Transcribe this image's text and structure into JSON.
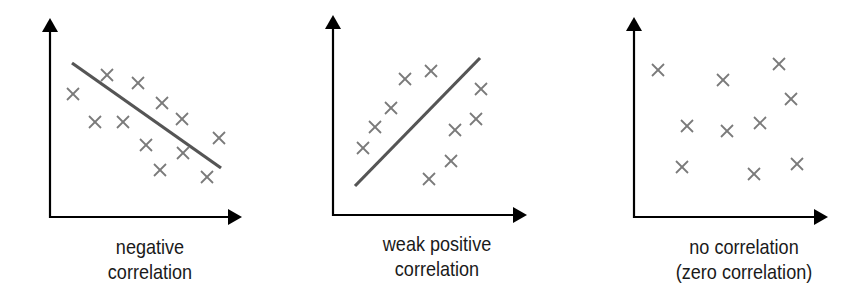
{
  "colors": {
    "axis": "#000000",
    "marker": "#7a7a7a",
    "trend_line": "#555555",
    "text": "#1a1a1a",
    "background": "#ffffff"
  },
  "chart_data": [
    {
      "type": "scatter",
      "title": "negative correlation",
      "caption_lines": [
        "negative",
        "correlation"
      ],
      "xlabel": "",
      "ylabel": "",
      "marker": "x",
      "grid": false,
      "axes": {
        "origin": [
          50,
          217
        ],
        "y_tip": [
          50,
          18
        ],
        "x_tip": [
          242,
          217
        ]
      },
      "points": [
        [
          73,
          94
        ],
        [
          107,
          75
        ],
        [
          138,
          83
        ],
        [
          95,
          122
        ],
        [
          123,
          122
        ],
        [
          162,
          103
        ],
        [
          182,
          119
        ],
        [
          146,
          145
        ],
        [
          219,
          138
        ],
        [
          183,
          153
        ],
        [
          160,
          170
        ],
        [
          207,
          177
        ]
      ],
      "trend_line": {
        "from": [
          72,
          63
        ],
        "to": [
          221,
          168
        ]
      },
      "caption_center_x": 150
    },
    {
      "type": "scatter",
      "title": "weak positive correlation",
      "caption_lines": [
        "weak positive",
        "correlation"
      ],
      "xlabel": "",
      "ylabel": "",
      "marker": "x",
      "grid": false,
      "axes": {
        "origin": [
          333,
          215
        ],
        "y_tip": [
          333,
          15
        ],
        "x_tip": [
          527,
          215
        ]
      },
      "points": [
        [
          363,
          148
        ],
        [
          375,
          127
        ],
        [
          391,
          108
        ],
        [
          405,
          79
        ],
        [
          431,
          71
        ],
        [
          481,
          89
        ],
        [
          476,
          119
        ],
        [
          455,
          130
        ],
        [
          451,
          161
        ],
        [
          429,
          179
        ]
      ],
      "trend_line": {
        "from": [
          355,
          186
        ],
        "to": [
          480,
          58
        ]
      },
      "caption_center_x": 437
    },
    {
      "type": "scatter",
      "title": "no correlation (zero correlation)",
      "caption_lines": [
        "no correlation",
        "(zero correlation)"
      ],
      "xlabel": "",
      "ylabel": "",
      "marker": "x",
      "grid": false,
      "axes": {
        "origin": [
          634,
          217
        ],
        "y_tip": [
          634,
          17
        ],
        "x_tip": [
          828,
          217
        ]
      },
      "points": [
        [
          658,
          70
        ],
        [
          723,
          80
        ],
        [
          779,
          64
        ],
        [
          791,
          99
        ],
        [
          687,
          126
        ],
        [
          727,
          131
        ],
        [
          760,
          123
        ],
        [
          682,
          167
        ],
        [
          754,
          174
        ],
        [
          797,
          164
        ]
      ],
      "trend_line": null,
      "caption_center_x": 744
    }
  ]
}
